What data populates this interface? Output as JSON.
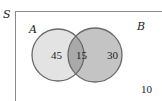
{
  "diagram": {
    "type": "venn",
    "universe_label": "S",
    "sets": [
      {
        "label": "A",
        "only_count": "45",
        "fill": "#e3e3e3"
      },
      {
        "label": "B",
        "only_count": "30",
        "fill": "#c4c4c4"
      }
    ],
    "intersection_count": "15",
    "outside_count": "10",
    "colors": {
      "outline": "#6a6a6a",
      "frame": "#8a8a8a",
      "intersection_fill": "#a9a9a9"
    }
  }
}
